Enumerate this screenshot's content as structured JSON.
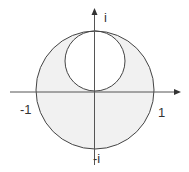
{
  "figure": {
    "colors": {
      "stroke": "#444444",
      "axis": "#555555",
      "shade": "#f1f1f1",
      "background": "#ffffff"
    },
    "axes": {
      "x_positive_label": "1",
      "x_negative_label": "-1",
      "y_positive_label": "i",
      "y_negative_label": "-i"
    },
    "shapes": {
      "outer_circle": {
        "center": [
          0,
          0
        ],
        "radius": 1,
        "shaded": true
      },
      "inner_circle": {
        "center": [
          0,
          0.5
        ],
        "radius": 0.5,
        "shaded": false
      }
    }
  }
}
